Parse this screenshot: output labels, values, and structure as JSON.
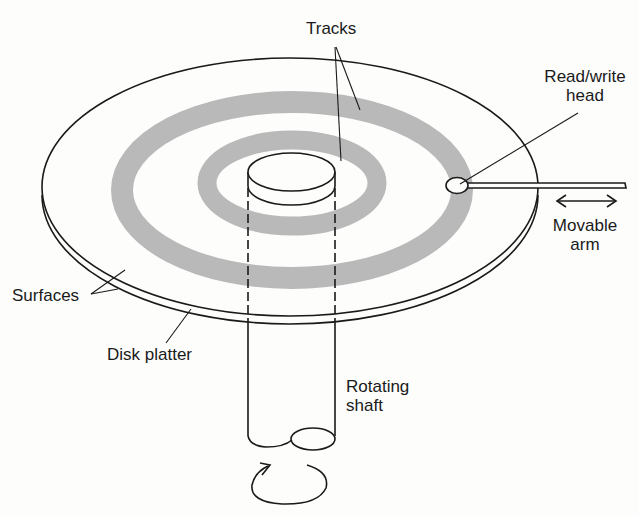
{
  "diagram": {
    "type": "disk-drive-schematic",
    "labels": {
      "tracks": "Tracks",
      "read_write_head_line1": "Read/write",
      "read_write_head_line2": "head",
      "movable_arm_line1": "Movable",
      "movable_arm_line2": "arm",
      "surfaces": "Surfaces",
      "disk_platter": "Disk platter",
      "rotating_shaft_line1": "Rotating",
      "rotating_shaft_line2": "shaft"
    },
    "colors": {
      "line": "#1a1a1a",
      "track_fill": "#b9b9b9",
      "background": "#fdfdfc"
    },
    "icons": {
      "arm_motion": "double-headed-arrow",
      "rotation": "circular-arrow"
    }
  }
}
